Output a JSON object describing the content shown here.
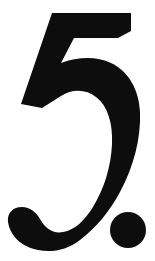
{
  "page": {
    "background_color": "#ffffff",
    "width": 155,
    "height": 261
  },
  "content": {
    "type": "typographic-numeral",
    "text": "5.",
    "number_label": "5",
    "punctuation_label": ".",
    "description": "Large bold black numeral five followed by a period on a plain white background",
    "ink_color": "#0d0d0d",
    "alignment": "centered"
  },
  "metrics": {
    "top_bar": {
      "x": 52,
      "y": 13,
      "width": 79,
      "height": 25
    },
    "bowl": {
      "right_edge": 128,
      "stroke_thickness": 31
    },
    "left_terminal": {
      "x": 8,
      "y": 212,
      "width": 52,
      "height": 38
    },
    "period": {
      "center_x": 128,
      "center_y": 230,
      "radius": 18
    }
  }
}
